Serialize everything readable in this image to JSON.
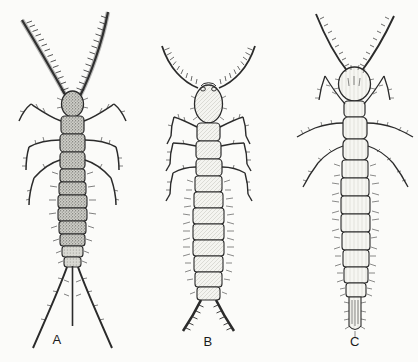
{
  "plate": {
    "background_color": "#fbfbf9",
    "ink_color": "#2b2b2b",
    "width": 418,
    "height": 362,
    "kind": "scientific-line-drawing",
    "subject": "three apterygote insects in dorsal view"
  },
  "figures": [
    {
      "key": "A",
      "label": "A",
      "label_x": 57,
      "label_y": 338,
      "center_x": 72,
      "shading": "dark",
      "head": "small oval head, densely stippled",
      "antennae": "two long straight segmented antennae forming a wide V",
      "legs": "three pairs of setose legs on thorax",
      "abdomen": "ten narrow segmented abdominal rings, heavily shaded",
      "tail": "two long slender segmented cerci spreading in a V",
      "body_top": 95,
      "body_bottom": 265
    },
    {
      "key": "B",
      "label": "B",
      "label_x": 208,
      "label_y": 340,
      "center_x": 207,
      "shading": "light",
      "head": "large elongate oval head, pale",
      "antennae": "two long curved segmented antennae arcing outward and upward",
      "legs": "three pairs of short stout legs on thorax",
      "abdomen": "broad pale segmented abdomen with fringing setae",
      "tail": "two short segmented cerci angled outward",
      "body_top": 85,
      "body_bottom": 305
    },
    {
      "key": "C",
      "label": "C",
      "label_x": 355,
      "label_y": 340,
      "center_x": 355,
      "shading": "light",
      "head": "rounded globular head with setae",
      "antennae": "two long straight segmented antennae forming a narrow V",
      "legs": "three pairs of long setose legs on thorax",
      "abdomen": "tapering segmented abdomen with dense lateral setae",
      "tail": "single short terminal filament with setae",
      "body_top": 60,
      "body_bottom": 320
    }
  ]
}
